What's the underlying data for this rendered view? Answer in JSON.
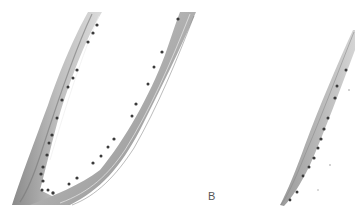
{
  "figure": {
    "panel_label": "B",
    "colors": {
      "background": "#ffffff",
      "tissue_light": "#d6d6d6",
      "tissue_mid": "#a9a9a9",
      "tissue_dark": "#7a7a7a",
      "nucleus": "#3a3a3a"
    }
  }
}
